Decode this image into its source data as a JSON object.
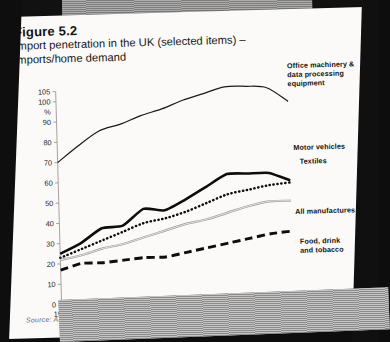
{
  "figure": {
    "number": "Figure 5.2",
    "title": "Import penetration in the UK (selected items) – imports/home demand",
    "source": "Source: Annual Abstract of Statistics"
  },
  "axis": {
    "y_unit": "%",
    "y_ticks": [
      "0",
      "10",
      "20",
      "30",
      "40",
      "50",
      "60",
      "70",
      "80",
      "90",
      "100",
      "105"
    ],
    "x_ticks": [
      "1975",
      "76",
      "77",
      "78",
      "79",
      "80",
      "81",
      "82",
      "83",
      "84",
      "85",
      "86"
    ]
  },
  "legend": {
    "office": "Office machinery &\ndata processing\nequipment",
    "motor": "Motor vehicles",
    "textiles": "Textiles",
    "all_manufactures": "All manufactures",
    "food": "Food, drink\nand tobacco"
  },
  "chart_data": {
    "type": "line",
    "title": "Import penetration in the UK (selected items) – imports/home demand",
    "xlabel": "",
    "ylabel": "%",
    "x": [
      1975,
      1976,
      1977,
      1978,
      1979,
      1980,
      1981,
      1982,
      1983,
      1984,
      1985,
      1986
    ],
    "xlim": [
      1975,
      1986
    ],
    "ylim": [
      0,
      105
    ],
    "yticks": [
      0,
      10,
      20,
      30,
      40,
      50,
      60,
      70,
      80,
      90,
      100,
      105
    ],
    "grid": false,
    "legend_position": "right-inline",
    "series": [
      {
        "name": "Office machinery & data processing equipment",
        "style": "solid-thin",
        "values": [
          70,
          78,
          85,
          88,
          92,
          95,
          99,
          102,
          105,
          105,
          104,
          97
        ]
      },
      {
        "name": "Motor vehicles",
        "style": "solid-thick",
        "values": [
          25,
          30,
          37,
          38,
          46,
          45,
          50,
          56,
          62,
          62,
          62,
          58
        ]
      },
      {
        "name": "Textiles",
        "style": "dotted",
        "values": [
          23,
          27,
          31,
          35,
          39,
          41,
          44,
          48,
          52,
          54,
          56,
          57
        ]
      },
      {
        "name": "All manufactures",
        "style": "double-thin",
        "values": [
          22,
          24,
          27,
          29,
          32,
          35,
          38,
          40,
          43,
          46,
          48,
          48
        ]
      },
      {
        "name": "Food, drink and tobacco",
        "style": "dashed-thick",
        "values": [
          17,
          20,
          20,
          21,
          22,
          22,
          24,
          26,
          28,
          30,
          32,
          33
        ]
      }
    ]
  }
}
